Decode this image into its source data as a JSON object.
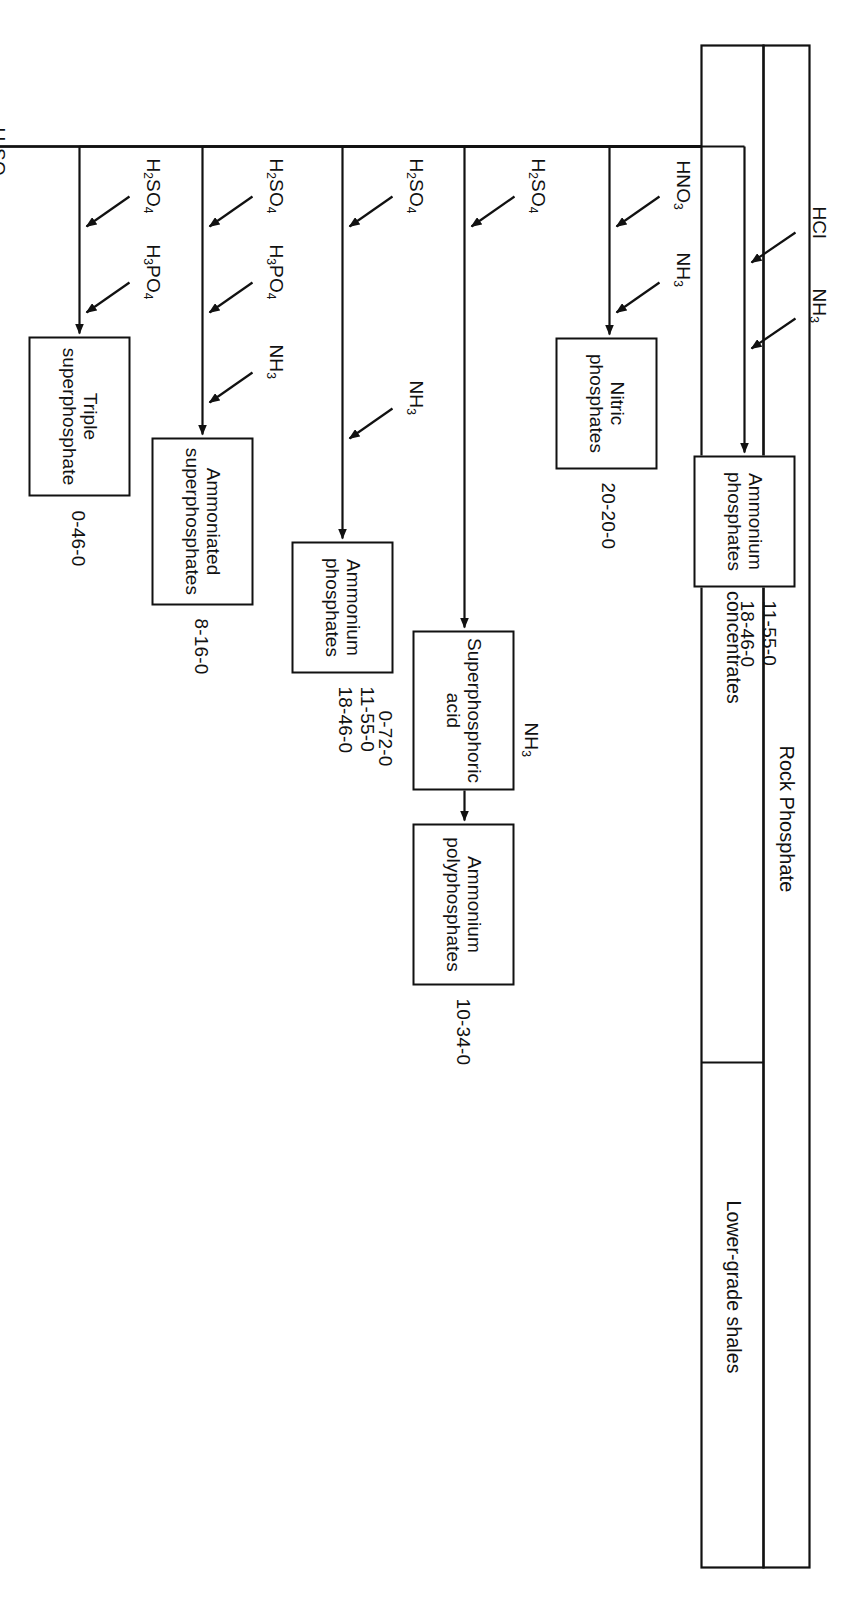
{
  "figure": {
    "caption": "FIGURE 18.5",
    "source_material": "Rock Phosphate",
    "branches": {
      "higher": "Higher-grade concentrates",
      "lower": "Lower-grade shales"
    }
  },
  "reagents": {
    "hcl": "HCl",
    "nh3": "NH",
    "nh3_sub": "3",
    "hno3": "HNO",
    "hno3_sub": "3",
    "h2so4_h": "H",
    "h2so4_sub1": "2",
    "h2so4_mid": "SO",
    "h2so4_sub2": "4",
    "h3po4_h": "H",
    "h3po4_sub1": "3",
    "h3po4_mid": "PO",
    "h3po4_sub2": "4",
    "elemental_p": "Elemental P",
    "heat": "Heat",
    "coke": "Coke",
    "silica": "Silica",
    "electricity": "Electricity"
  },
  "products": [
    {
      "id": "ammonium-phosphates-hcl",
      "line1": "Ammonium",
      "line2": "phosphates",
      "values": [
        "11-55-0",
        "18-46-0"
      ],
      "inputs": [
        "HCl",
        "NH3"
      ]
    },
    {
      "id": "nitric-phosphates",
      "line1": "Nitric",
      "line2": "phosphates",
      "values": [
        "20-20-0"
      ],
      "inputs": [
        "HNO3",
        "NH3"
      ]
    },
    {
      "id": "superphosphoric-acid-high",
      "line1": "Superphosphoric",
      "line2": "acid",
      "values": [
        "0-72-0"
      ],
      "inputs": [
        "H2SO4"
      ]
    },
    {
      "id": "ammonium-polyphosphates-high",
      "line1": "Ammonium",
      "line2": "polyphosphates",
      "values": [
        "10-34-0"
      ],
      "inputs": [
        "NH3"
      ]
    },
    {
      "id": "ammonium-phosphates-h2so4",
      "line1": "Ammonium",
      "line2": "phosphates",
      "values": [
        "11-55-0",
        "18-46-0"
      ],
      "inputs": [
        "H2SO4",
        "NH3"
      ]
    },
    {
      "id": "ammoniated-superphosphates",
      "line1": "Ammoniated",
      "line2": "superphosphates",
      "values": [
        "8-16-0"
      ],
      "inputs": [
        "H2SO4",
        "H3PO4",
        "NH3"
      ]
    },
    {
      "id": "triple-superphosphate",
      "line1": "Triple",
      "line2": "superphosphate",
      "values": [
        "0-46-0"
      ],
      "inputs": [
        "H2SO4",
        "H3PO4"
      ]
    },
    {
      "id": "normal-superphosphate",
      "line1": "Normal",
      "line2": "superphosphate",
      "values": [
        "0-20-0"
      ],
      "inputs": [
        "H2SO4"
      ]
    },
    {
      "id": "metaphosphates",
      "line1": "Metaphosphates",
      "line2": "",
      "values": [
        "0-64-0"
      ],
      "inputs": [
        "Elemental P",
        "Heat"
      ]
    },
    {
      "id": "superphosphoric-acid-low",
      "line1": "Superphosphoric",
      "line2": "acid",
      "values": [
        "0-80-0"
      ],
      "inputs": [
        "Coke",
        "Silica",
        "Electricity"
      ]
    },
    {
      "id": "ammonium-polyphosphates-low",
      "line1": "Ammonium",
      "line2": "polyphosphates",
      "values": [
        "11-37-0"
      ],
      "inputs": [
        "NH3"
      ]
    }
  ],
  "colors": {
    "ink": "#111111",
    "paper": "#ffffff"
  }
}
